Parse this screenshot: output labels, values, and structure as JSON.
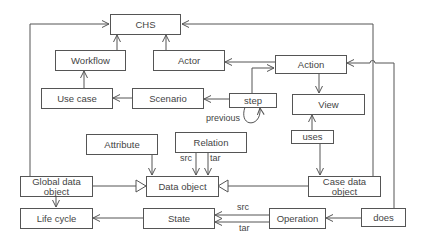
{
  "diagram": {
    "nodes": {
      "chs": "CHS",
      "workflow": "Workflow",
      "actor": "Actor",
      "action": "Action",
      "use_case": "Use case",
      "scenario": "Scenario",
      "step": "step",
      "view": "View",
      "uses": "uses",
      "attribute": "Attribute",
      "relation": "Relation",
      "global_data_object": "Global data object",
      "data_object": "Data object",
      "case_data_object": "Case data object",
      "life_cycle": "Life cycle",
      "state": "State",
      "operation": "Operation",
      "does": "does"
    },
    "edge_labels": {
      "previous": "previous",
      "relation_src": "src",
      "relation_tar": "tar",
      "operation_src": "src",
      "operation_tar": "tar"
    },
    "edges": [
      {
        "from": "Workflow",
        "to": "CHS"
      },
      {
        "from": "Actor",
        "to": "CHS"
      },
      {
        "from": "Global data object",
        "to": "CHS"
      },
      {
        "from": "Case data object",
        "to": "CHS"
      },
      {
        "from": "Use case",
        "to": "Workflow"
      },
      {
        "from": "Scenario",
        "to": "Use case"
      },
      {
        "from": "step",
        "to": "Scenario"
      },
      {
        "from": "step",
        "to": "Action"
      },
      {
        "from": "step",
        "to": "step",
        "label": "previous"
      },
      {
        "from": "Action",
        "to": "Actor"
      },
      {
        "from": "Action",
        "to": "View"
      },
      {
        "from": "uses",
        "to": "View"
      },
      {
        "from": "uses",
        "to": "Case data object"
      },
      {
        "from": "Attribute",
        "to": "Data object"
      },
      {
        "from": "Relation",
        "to": "Data object",
        "label": "src"
      },
      {
        "from": "Relation",
        "to": "Data object",
        "label": "tar"
      },
      {
        "from": "Global data object",
        "to": "Data object",
        "type": "generalization"
      },
      {
        "from": "Case data object",
        "to": "Data object",
        "type": "generalization"
      },
      {
        "from": "Global data object",
        "to": "Life cycle"
      },
      {
        "from": "State",
        "to": "Life cycle"
      },
      {
        "from": "Operation",
        "to": "State",
        "label": "src"
      },
      {
        "from": "Operation",
        "to": "State",
        "label": "tar"
      },
      {
        "from": "does",
        "to": "Operation"
      },
      {
        "from": "does",
        "to": "Action"
      }
    ]
  }
}
